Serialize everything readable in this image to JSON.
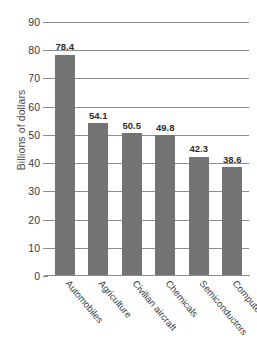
{
  "chart_data": {
    "type": "bar",
    "title": "",
    "xlabel": "",
    "ylabel": "Billions of dollars",
    "categories": [
      "Automobiles",
      "Agriculture",
      "Civilian aircraft",
      "Chemicals",
      "Semiconductors",
      "Computers"
    ],
    "values": [
      78.4,
      54.1,
      50.5,
      49.8,
      42.3,
      38.6
    ],
    "value_labels": [
      "78.4",
      "54.1",
      "50.5",
      "49.8",
      "42.3",
      "38.6"
    ],
    "ylim": [
      0,
      90
    ],
    "ytick_labels": [
      "0",
      "10",
      "20",
      "30",
      "40",
      "50",
      "60",
      "70",
      "80",
      "90"
    ],
    "ytick_values": [
      0,
      10,
      20,
      30,
      40,
      50,
      60,
      70,
      80,
      90
    ],
    "grid": true,
    "legend": "none",
    "bar_color": "#737373",
    "grid_color": "#8c8c8c",
    "background_color": "#ffffff"
  }
}
